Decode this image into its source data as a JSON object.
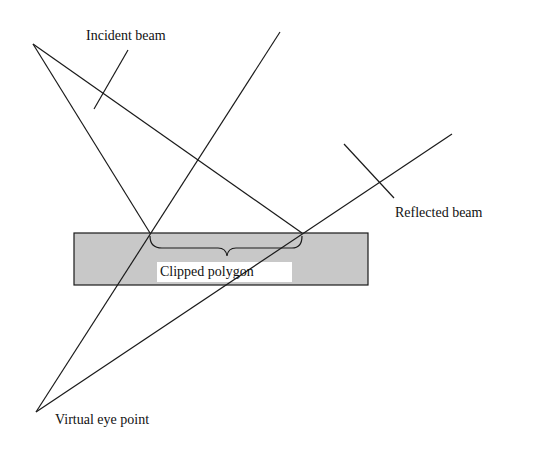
{
  "diagram": {
    "labels": {
      "incident": "Incident beam",
      "reflected": "Reflected beam",
      "clipped": "Clipped polygon",
      "eye": "Virtual eye point"
    },
    "colors": {
      "line": "#1a1a1a",
      "mirror_fill": "#c8c8c8",
      "background": "#ffffff"
    }
  }
}
